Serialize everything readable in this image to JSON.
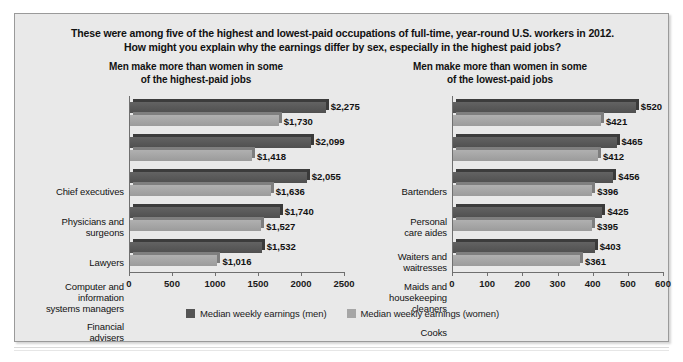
{
  "figure": {
    "title_line1": "These were among five of the highest and lowest-paid occupations of full-time, year-round U.S. workers in 2012.",
    "title_line2": "How might you explain why the earnings differ by sex, especially in the highest paid jobs?",
    "background_color": "#e9e9e9",
    "border_color": "#9a9a9a"
  },
  "legend": {
    "men_label": "Median weekly earnings (men)",
    "women_label": "Median weekly earnings (women)",
    "men_color": "#545454",
    "women_color": "#a6a6a6"
  },
  "chart_data": [
    {
      "type": "bar",
      "title": "Men make more than women in some of the highest-paid jobs",
      "title_line1": "Men make more than women in some",
      "title_line2": "of the highest-paid jobs",
      "orientation": "horizontal",
      "categories": [
        "Chief executives",
        "Physicians and surgeons",
        "Lawyers",
        "Computer and information systems managers",
        "Financial advisers"
      ],
      "category_lines": [
        [
          "Chief executives"
        ],
        [
          "Physicians and",
          "surgeons"
        ],
        [
          "Lawyers"
        ],
        [
          "Computer and",
          "information",
          "systems managers"
        ],
        [
          "Financial",
          "advisers"
        ]
      ],
      "series": [
        {
          "name": "Median weekly earnings (men)",
          "values": [
            2275,
            2099,
            2055,
            1740,
            1532
          ],
          "labels": [
            "$2,275",
            "$2,099",
            "$2,055",
            "$1,740",
            "$1,532"
          ]
        },
        {
          "name": "Median weekly earnings (women)",
          "values": [
            1730,
            1418,
            1636,
            1527,
            1016
          ],
          "labels": [
            "$1,730",
            "$1,418",
            "$1,636",
            "$1,527",
            "$1,016"
          ]
        }
      ],
      "xlabel": "",
      "ylabel": "",
      "xlim": [
        0,
        2500
      ],
      "xticks": [
        0,
        500,
        1000,
        1500,
        2000,
        2500
      ],
      "xticklabels": [
        "0",
        "500",
        "1000",
        "1500",
        "2000",
        "2500"
      ],
      "grid": false,
      "legend_position": "bottom"
    },
    {
      "type": "bar",
      "title": "Men make more than women in some of the lowest-paid jobs",
      "title_line1": "Men make more than women in some",
      "title_line2": "of the lowest-paid jobs",
      "orientation": "horizontal",
      "categories": [
        "Bartenders",
        "Personal care aides",
        "Waiters and waitresses",
        "Maids and housekeeping cleaners",
        "Cooks"
      ],
      "category_lines": [
        [
          "Bartenders"
        ],
        [
          "Personal",
          "care aides"
        ],
        [
          "Waiters and",
          "waitresses"
        ],
        [
          "Maids and",
          "housekeeping",
          "cleaners"
        ],
        [
          "Cooks"
        ]
      ],
      "series": [
        {
          "name": "Median weekly earnings (men)",
          "values": [
            520,
            465,
            456,
            425,
            403
          ],
          "labels": [
            "$520",
            "$465",
            "$456",
            "$425",
            "$403"
          ]
        },
        {
          "name": "Median weekly earnings (women)",
          "values": [
            421,
            412,
            396,
            395,
            361
          ],
          "labels": [
            "$421",
            "$412",
            "$396",
            "$395",
            "$361"
          ]
        }
      ],
      "xlabel": "",
      "ylabel": "",
      "xlim": [
        0,
        600
      ],
      "xticks": [
        0,
        100,
        200,
        300,
        400,
        500,
        600
      ],
      "xticklabels": [
        "0",
        "100",
        "200",
        "300",
        "400",
        "500",
        "600"
      ],
      "grid": false,
      "legend_position": "bottom"
    }
  ]
}
